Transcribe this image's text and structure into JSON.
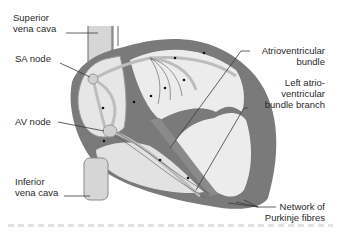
{
  "diagram": {
    "colors": {
      "wall": "#7a7a7a",
      "chamber": "#ececec",
      "vessel": "#d6d6d6",
      "node": "#d0d0d0",
      "leader": "#3a3a3a",
      "text": "#2a2a2a"
    },
    "labels": {
      "superior_vena_cava": [
        "Superior",
        "vena cava"
      ],
      "sa_node": "SA node",
      "av_node": "AV node",
      "inferior_vena_cava": [
        "Inferior",
        "vena cava"
      ],
      "av_bundle": [
        "Atrioventricular",
        "bundle"
      ],
      "left_branch": [
        "Left atrio-",
        "ventricular",
        "bundle branch"
      ],
      "purkinje": [
        "Network of",
        "Purkinje fibres"
      ]
    }
  }
}
